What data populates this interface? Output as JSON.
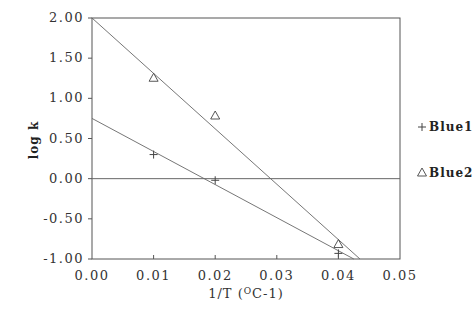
{
  "chart_data": {
    "type": "scatter",
    "title": "",
    "xlabel": "1/T (°C-1)",
    "xlabel_parts": {
      "prefix": "1/T  (",
      "sup": "O",
      "suffix": "C-1)"
    },
    "ylabel": "log k",
    "xlim": [
      0.0,
      0.05
    ],
    "ylim": [
      -1.0,
      2.0
    ],
    "x_ticks": [
      0.0,
      0.01,
      0.02,
      0.03,
      0.04,
      0.05
    ],
    "x_tick_labels": [
      "0.00",
      "0.01",
      "0.02",
      "0.03",
      "0.04",
      "0.05"
    ],
    "y_ticks": [
      2.0,
      1.5,
      1.0,
      0.5,
      0.0,
      -0.5,
      -1.0
    ],
    "y_tick_labels": [
      "2.00",
      "1.50",
      "1.00",
      "0.50",
      "0.00",
      "-0.50",
      "-1.00"
    ],
    "grid": false,
    "zero_line": true,
    "legend_position": "right",
    "series": [
      {
        "name": "Blue1",
        "marker": "+",
        "x": [
          0.01,
          0.02,
          0.04
        ],
        "y": [
          0.3,
          -0.02,
          -0.93
        ],
        "fit_line": {
          "x": [
            0.0,
            0.0425
          ],
          "y": [
            0.75,
            -1.0
          ]
        }
      },
      {
        "name": "Blue2",
        "marker": "triangle",
        "x": [
          0.01,
          0.02,
          0.04
        ],
        "y": [
          1.25,
          0.78,
          -0.82
        ],
        "fit_line": {
          "x": [
            0.0,
            0.0435
          ],
          "y": [
            2.0,
            -1.0
          ]
        }
      }
    ],
    "legend": [
      {
        "symbol": "+",
        "label": "Blue1"
      },
      {
        "symbol": "△",
        "label": "Blue2"
      }
    ],
    "colors": {
      "axis": "#555555",
      "line": "#666666",
      "marker": "#444444",
      "text": "#222222"
    }
  }
}
